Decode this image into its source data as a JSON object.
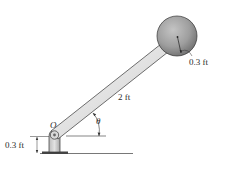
{
  "diagram": {
    "type": "mechanics-figure",
    "labels": {
      "pivot": "O",
      "rod_length": "2 ft",
      "angle": "θ",
      "ball_radius": "0.3 ft",
      "pivot_height": "0.3 ft"
    },
    "colors": {
      "ball": "#9a9a9a",
      "rod": "#e6e6e6",
      "outline": "#333333",
      "ground": "#555555"
    }
  }
}
